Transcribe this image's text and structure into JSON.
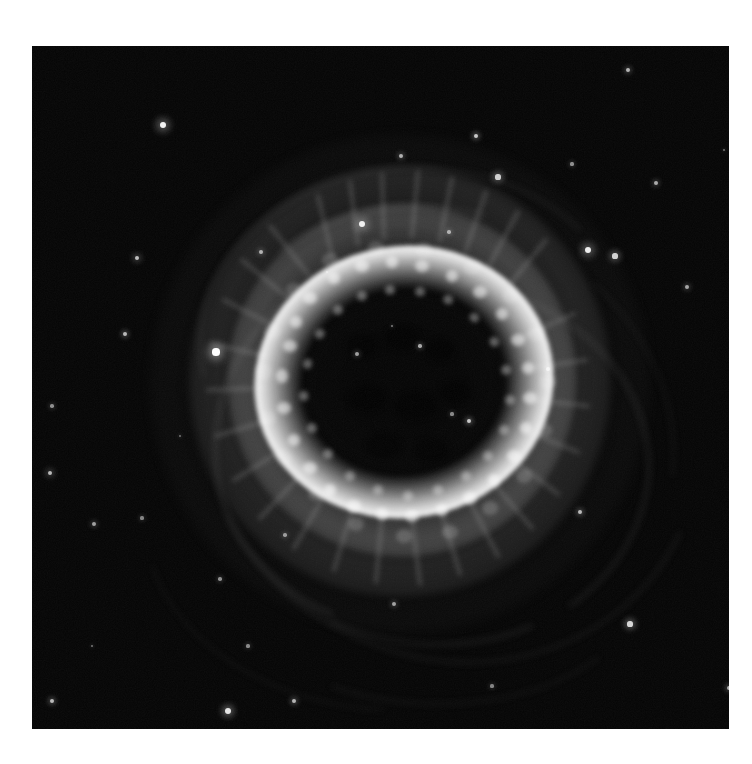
{
  "page": {
    "background_color": "#ffffff",
    "width": 752,
    "height": 764
  },
  "plate": {
    "name": "astronomical-photographic-plate",
    "left": 32,
    "top": 46,
    "width": 697,
    "height": 683,
    "sky_background_color": "#040404",
    "border_color": "#ffffff"
  },
  "subject": {
    "object_type": "planetary-nebula",
    "appearance": "bright elliptical ring with dark central cavity, surrounded by diffuse mottled halo and faint outer arcs",
    "center_x": 383,
    "center_y": 360
  },
  "nebula_structure": {
    "bright_ring": {
      "center_x": 372,
      "center_y": 336,
      "width": 300,
      "height": 272,
      "rotation_deg": -10,
      "peak_color": "#ffffff"
    },
    "central_cavity": {
      "center_x": 371,
      "center_y": 336,
      "width": 186,
      "height": 168,
      "color": "#050505"
    },
    "mottled_shell": {
      "width": 348,
      "height": 352,
      "color": "#c8c8c8"
    },
    "mid_halo": {
      "width": 420,
      "height": 430,
      "color": "#aaaaaa"
    },
    "outer_halo": {
      "width": 500,
      "height": 500,
      "color": "#787878"
    }
  },
  "chart_data": {
    "type": "scatter",
    "title": "",
    "xlabel": "",
    "ylabel": "",
    "series": [
      {
        "name": "stars",
        "points": [
          {
            "x": 131,
            "y": 79,
            "r": 3.4,
            "b": 0.95
          },
          {
            "x": 444,
            "y": 90,
            "r": 2.2,
            "b": 0.78
          },
          {
            "x": 596,
            "y": 24,
            "r": 2.0,
            "b": 0.7
          },
          {
            "x": 790,
            "y": 32,
            "r": 2.2,
            "b": 0.75
          },
          {
            "x": 369,
            "y": 110,
            "r": 2.0,
            "b": 0.68
          },
          {
            "x": 466,
            "y": 131,
            "r": 2.6,
            "b": 0.8
          },
          {
            "x": 540,
            "y": 118,
            "r": 1.6,
            "b": 0.55
          },
          {
            "x": 624,
            "y": 137,
            "r": 2.0,
            "b": 0.66
          },
          {
            "x": 330,
            "y": 178,
            "r": 3.2,
            "b": 0.92
          },
          {
            "x": 417,
            "y": 186,
            "r": 1.8,
            "b": 0.6
          },
          {
            "x": 229,
            "y": 206,
            "r": 2.0,
            "b": 0.66
          },
          {
            "x": 105,
            "y": 212,
            "r": 2.4,
            "b": 0.74
          },
          {
            "x": 556,
            "y": 204,
            "r": 3.2,
            "b": 0.93
          },
          {
            "x": 583,
            "y": 210,
            "r": 2.6,
            "b": 0.82
          },
          {
            "x": 655,
            "y": 241,
            "r": 2.0,
            "b": 0.64
          },
          {
            "x": 872,
            "y": 176,
            "r": 2.2,
            "b": 0.7
          },
          {
            "x": 93,
            "y": 288,
            "r": 2.2,
            "b": 0.72
          },
          {
            "x": 325,
            "y": 308,
            "r": 2.0,
            "b": 0.62
          },
          {
            "x": 516,
            "y": 323,
            "r": 2.0,
            "b": 0.66
          },
          {
            "x": 726,
            "y": 296,
            "r": 2.4,
            "b": 0.76
          },
          {
            "x": 795,
            "y": 331,
            "r": 2.6,
            "b": 0.8
          },
          {
            "x": 20,
            "y": 360,
            "r": 1.8,
            "b": 0.55
          },
          {
            "x": 18,
            "y": 427,
            "r": 2.4,
            "b": 0.72
          },
          {
            "x": 62,
            "y": 478,
            "r": 2.0,
            "b": 0.62
          },
          {
            "x": 184,
            "y": 306,
            "r": 3.6,
            "b": 1.0
          },
          {
            "x": 548,
            "y": 466,
            "r": 2.2,
            "b": 0.72
          },
          {
            "x": 598,
            "y": 578,
            "r": 2.6,
            "b": 0.84
          },
          {
            "x": 728,
            "y": 497,
            "r": 2.2,
            "b": 0.7
          },
          {
            "x": 110,
            "y": 472,
            "r": 1.6,
            "b": 0.5
          },
          {
            "x": 253,
            "y": 489,
            "r": 1.8,
            "b": 0.56
          },
          {
            "x": 127,
            "y": 719,
            "r": 3.0,
            "b": 0.9
          },
          {
            "x": 188,
            "y": 533,
            "r": 1.8,
            "b": 0.55
          },
          {
            "x": 216,
            "y": 600,
            "r": 1.6,
            "b": 0.52
          },
          {
            "x": 362,
            "y": 558,
            "r": 2.0,
            "b": 0.62
          },
          {
            "x": 530,
            "y": 752,
            "r": 2.0,
            "b": 0.6
          },
          {
            "x": 697,
            "y": 642,
            "r": 2.2,
            "b": 0.68
          },
          {
            "x": 262,
            "y": 655,
            "r": 2.2,
            "b": 0.7
          },
          {
            "x": 319,
            "y": 730,
            "r": 2.4,
            "b": 0.76
          },
          {
            "x": 20,
            "y": 655,
            "r": 2.2,
            "b": 0.72
          },
          {
            "x": 12,
            "y": 700,
            "r": 1.6,
            "b": 0.5
          },
          {
            "x": 22,
            "y": 715,
            "r": 3.0,
            "b": 0.92
          },
          {
            "x": 196,
            "y": 665,
            "r": 3.0,
            "b": 0.9
          },
          {
            "x": 388,
            "y": 300,
            "r": 1.8,
            "b": 0.66
          },
          {
            "x": 360,
            "y": 280,
            "r": 1.4,
            "b": 0.48
          },
          {
            "x": 420,
            "y": 368,
            "r": 1.6,
            "b": 0.52
          },
          {
            "x": 437,
            "y": 375,
            "r": 2.2,
            "b": 0.78
          },
          {
            "x": 295,
            "y": 226,
            "r": 1.4,
            "b": 0.45
          },
          {
            "x": 868,
            "y": 430,
            "r": 1.6,
            "b": 0.5
          },
          {
            "x": 830,
            "y": 560,
            "r": 1.6,
            "b": 0.5
          },
          {
            "x": 636,
            "y": 688,
            "r": 1.8,
            "b": 0.58
          },
          {
            "x": 460,
            "y": 640,
            "r": 1.6,
            "b": 0.5
          },
          {
            "x": 60,
            "y": 600,
            "r": 1.4,
            "b": 0.45
          },
          {
            "x": 148,
            "y": 390,
            "r": 1.4,
            "b": 0.42
          },
          {
            "x": 692,
            "y": 104,
            "r": 1.4,
            "b": 0.44
          },
          {
            "x": 882,
            "y": 652,
            "r": 1.6,
            "b": 0.48
          }
        ]
      }
    ],
    "axis": {
      "grid": false,
      "visible_axes": false
    },
    "legend": {
      "visible": false
    }
  }
}
